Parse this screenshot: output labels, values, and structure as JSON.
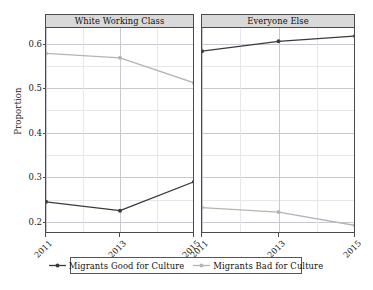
{
  "chart_data": {
    "type": "line",
    "title": "",
    "subtitle": "",
    "xlabel": "",
    "ylabel": "Proportion",
    "x": [
      "2011",
      "2013",
      "2015"
    ],
    "xtick_labels": [
      "2011",
      "2013",
      "2015"
    ],
    "ytick_labels": [
      "0.2",
      "0.3",
      "0.4",
      "0.5",
      "0.6"
    ],
    "ytick_values": [
      0.2,
      0.3,
      0.4,
      0.5,
      0.6
    ],
    "ylim": [
      0.175,
      0.635
    ],
    "y_minor_gridlines": [
      0.25,
      0.35,
      0.45,
      0.55
    ],
    "grid": true,
    "legend_position": "bottom",
    "facet_layout": "1x2",
    "facets": [
      {
        "label": "White Working Class",
        "series": [
          {
            "name": "Migrants Good for Culture",
            "values": [
              0.245,
              0.225,
              0.29
            ]
          },
          {
            "name": "Migrants Bad for Culture",
            "values": [
              0.578,
              0.568,
              0.512
            ]
          }
        ]
      },
      {
        "label": "Everyone Else",
        "series": [
          {
            "name": "Migrants Good for Culture",
            "values": [
              0.583,
              0.605,
              0.617
            ]
          },
          {
            "name": "Migrants Bad for Culture",
            "values": [
              0.232,
              0.222,
              0.192
            ]
          }
        ]
      }
    ],
    "legend": [
      {
        "label": "Migrants Good for Culture",
        "color": "#3a3a3a"
      },
      {
        "label": "Migrants Bad for Culture",
        "color": "#b4b4b4"
      }
    ],
    "colors": {
      "good": "#3a3a3a",
      "bad": "#b4b4b4",
      "strip_fill": "#d9d9d9",
      "panel_border": "#4a4a4a",
      "grid_major": "#c8c8d0",
      "grid_minor": "#e6e6ec",
      "background": "#ffffff"
    }
  }
}
